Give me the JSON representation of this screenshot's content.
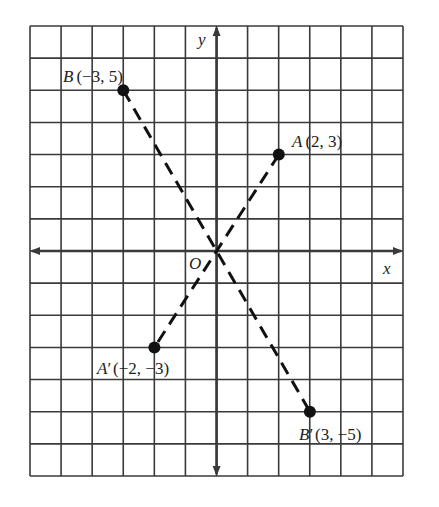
{
  "diagram": {
    "type": "coordinate-plane-reflection",
    "grid": {
      "x_range": [
        -6,
        6
      ],
      "y_range": [
        -7,
        7
      ],
      "pixel_bounds": {
        "left": 30,
        "right": 403,
        "top": 26,
        "bottom": 476
      },
      "origin_px": {
        "x": 216.6,
        "y": 251.0
      },
      "cell_w": 31.1,
      "cell_h": 32.14,
      "line_color": "#3a3a3a"
    },
    "axes": {
      "x_label": "x",
      "y_label": "y",
      "origin_label": "O"
    },
    "points": [
      {
        "id": "B",
        "name": "B",
        "prime": "",
        "coords_text": "(−3, 5)",
        "x": -3,
        "y": 5
      },
      {
        "id": "A",
        "name": "A",
        "prime": "",
        "coords_text": "(2, 3)",
        "x": 2,
        "y": 3
      },
      {
        "id": "A_prime",
        "name": "A",
        "prime": "′",
        "coords_text": "(−2, −3)",
        "x": -2,
        "y": -3
      },
      {
        "id": "B_prime",
        "name": "B",
        "prime": "′",
        "coords_text": "(3, −5)",
        "x": 3,
        "y": -5
      }
    ],
    "segments": [
      {
        "from": "B",
        "to": "B_prime",
        "style": "dashed"
      },
      {
        "from": "A",
        "to": "A_prime",
        "style": "dashed"
      }
    ],
    "colors": {
      "segment": "#111111",
      "point": "#111111",
      "text": "#222222"
    }
  }
}
